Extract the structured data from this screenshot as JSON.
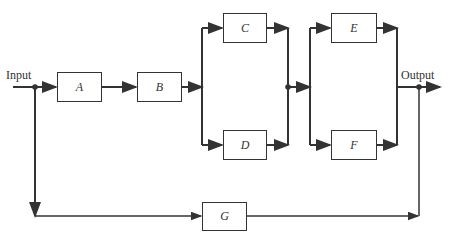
{
  "diagram": {
    "input_label": "Input",
    "output_label": "Output",
    "blocks": {
      "A": "A",
      "B": "B",
      "C": "C",
      "D": "D",
      "E": "E",
      "F": "F",
      "G": "G"
    },
    "colors": {
      "line": "#333333",
      "background": "#ffffff"
    }
  }
}
